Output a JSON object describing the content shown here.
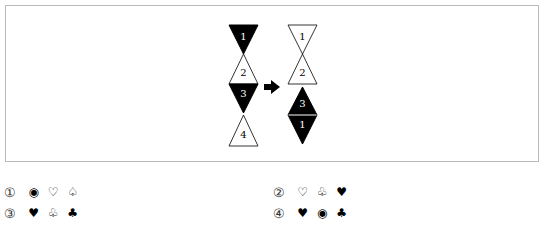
{
  "figure": {
    "before": {
      "triangles": [
        {
          "label": "1",
          "fill": "#000000",
          "orientation": "down"
        },
        {
          "label": "2",
          "fill": "#ffffff",
          "orientation": "up"
        },
        {
          "label": "3",
          "fill": "#000000",
          "orientation": "down"
        },
        {
          "label": "4",
          "fill": "#ffffff",
          "orientation": "up"
        }
      ]
    },
    "arrow": "right-arrow",
    "after": {
      "triangles": [
        {
          "label": "1",
          "fill": "#ffffff",
          "orientation": "down"
        },
        {
          "label": "2",
          "fill": "#ffffff",
          "orientation": "up"
        },
        {
          "label": "3",
          "fill": "#000000",
          "orientation": "up"
        },
        {
          "label": "1",
          "fill": "#000000",
          "orientation": "down"
        }
      ]
    }
  },
  "options": [
    {
      "number": "①",
      "symbols": [
        "◉",
        "♡",
        "♤"
      ]
    },
    {
      "number": "②",
      "symbols": [
        "♡",
        "♧",
        "♥"
      ]
    },
    {
      "number": "③",
      "symbols": [
        "♥",
        "♧",
        "♣"
      ]
    },
    {
      "number": "④",
      "symbols": [
        "♥",
        "◉",
        "♣"
      ]
    }
  ]
}
